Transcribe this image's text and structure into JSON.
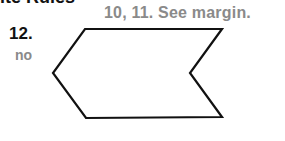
{
  "page": {
    "cut_heading": "ite Rules",
    "answer_note": "10, 11. See margin.",
    "exercise": {
      "number": "12.",
      "answer": "no"
    },
    "figure": {
      "shape": "concave hexagon (chevron)",
      "vertices": [
        [
          85,
          29
        ],
        [
          222,
          29
        ],
        [
          190,
          73
        ],
        [
          222,
          117
        ],
        [
          86,
          118
        ],
        [
          53,
          73
        ]
      ],
      "stroke_color": "#111111",
      "fill_color": "#ffffff"
    },
    "colors": {
      "text_dark": "#111111",
      "text_gray": "#8a8a8a"
    }
  }
}
